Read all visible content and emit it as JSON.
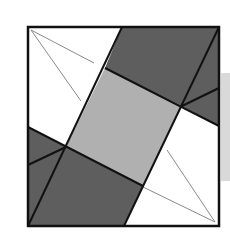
{
  "diagram": {
    "type": "geometric-dissection",
    "colors": {
      "background": "#ffffff",
      "outline": "#111111",
      "dark_fill": "#5e5e5e",
      "light_fill": "#b0b0b0",
      "white_fill": "#ffffff",
      "thin_line": "#8a8a8a",
      "side_band": "#d9d9d9"
    },
    "outer_square": {
      "x1": 28,
      "y1": 27,
      "x2": 219,
      "y2": 226
    },
    "inner_square": [
      [
        105,
        68
      ],
      [
        182,
        106
      ],
      [
        143,
        186
      ],
      [
        66,
        147
      ]
    ],
    "regions": [
      {
        "name": "top-dark-quad",
        "fill": "dark",
        "points": [
          [
            122,
            27
          ],
          [
            219,
            27
          ],
          [
            182,
            106
          ],
          [
            105,
            68
          ]
        ]
      },
      {
        "name": "right-dark-triangle",
        "fill": "dark",
        "points": [
          [
            219,
            27
          ],
          [
            219,
            126
          ],
          [
            182,
            106
          ]
        ]
      },
      {
        "name": "bottom-dark-quad",
        "fill": "dark",
        "points": [
          [
            66,
            147
          ],
          [
            143,
            186
          ],
          [
            124,
            226
          ],
          [
            28,
            226
          ]
        ]
      },
      {
        "name": "left-dark-triangle",
        "fill": "dark",
        "points": [
          [
            28,
            127
          ],
          [
            66,
            147
          ],
          [
            28,
            226
          ]
        ]
      },
      {
        "name": "center-light-square",
        "fill": "light",
        "points": [
          [
            105,
            68
          ],
          [
            182,
            106
          ],
          [
            143,
            186
          ],
          [
            66,
            147
          ]
        ]
      }
    ],
    "thick_lines": [
      [
        [
          122,
          27
        ],
        [
          28,
          226
        ]
      ],
      [
        [
          219,
          27
        ],
        [
          124,
          226
        ]
      ],
      [
        [
          105,
          68
        ],
        [
          219,
          126
        ]
      ],
      [
        [
          28,
          127
        ],
        [
          143,
          186
        ]
      ],
      [
        [
          182,
          106
        ],
        [
          219,
          88
        ]
      ],
      [
        [
          66,
          147
        ],
        [
          28,
          165
        ]
      ]
    ],
    "thin_lines": [
      [
        [
          31,
          30
        ],
        [
          94,
          63
        ]
      ],
      [
        [
          31,
          30
        ],
        [
          81,
          101
        ]
      ],
      [
        [
          215,
          222
        ],
        [
          167,
          150
        ]
      ],
      [
        [
          215,
          222
        ],
        [
          143,
          187
        ]
      ]
    ]
  }
}
